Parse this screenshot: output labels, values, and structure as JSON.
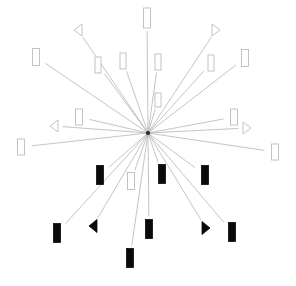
{
  "figure": {
    "title": "",
    "width": 296,
    "height": 286,
    "background_color": "#ffffff",
    "center": {
      "x": 148,
      "y": 133
    }
  },
  "style": {
    "ray_color": "#aaaaaa",
    "ray_width": 0.7,
    "open_marker_fill": "#ffffff",
    "open_marker_stroke": "#b5b5b5",
    "filled_marker_fill": "#0a0a0a",
    "filled_marker_stroke": "#0a0a0a",
    "marker_stroke_width": 0.8
  },
  "chart_data": {
    "type": "scatter",
    "title": "",
    "subtitle": "",
    "xlabel": "",
    "ylabel": "",
    "xlim": [
      0,
      296
    ],
    "ylim": [
      0,
      286
    ],
    "grid": false,
    "legend": null,
    "annotations": [],
    "center": {
      "x": 148,
      "y": 133
    },
    "tick_labels": [],
    "points": [
      {
        "id": "p01",
        "x": 147,
        "y": 18,
        "marker": "rect",
        "style": "open",
        "size": [
          7,
          20
        ],
        "angle_deg": 89,
        "radius": 115
      },
      {
        "id": "p02",
        "x": 78,
        "y": 30,
        "marker": "triangle-left",
        "style": "open",
        "size": [
          8,
          12
        ],
        "angle_deg": 124,
        "radius": 125
      },
      {
        "id": "p03",
        "x": 216,
        "y": 30,
        "marker": "triangle-right",
        "style": "open",
        "size": [
          8,
          12
        ],
        "angle_deg": 55,
        "radius": 124
      },
      {
        "id": "p04",
        "x": 36,
        "y": 57,
        "marker": "rect",
        "style": "open",
        "size": [
          7,
          17
        ],
        "angle_deg": 149,
        "radius": 132
      },
      {
        "id": "p05",
        "x": 98,
        "y": 65,
        "marker": "rect",
        "style": "open",
        "size": [
          6,
          16
        ],
        "angle_deg": 126,
        "radius": 85
      },
      {
        "id": "p06",
        "x": 123,
        "y": 61,
        "marker": "rect",
        "style": "open",
        "size": [
          6,
          16
        ],
        "angle_deg": 109,
        "radius": 76
      },
      {
        "id": "p07",
        "x": 158,
        "y": 62,
        "marker": "rect",
        "style": "open",
        "size": [
          6,
          16
        ],
        "angle_deg": 80,
        "radius": 72
      },
      {
        "id": "p08",
        "x": 211,
        "y": 63,
        "marker": "rect",
        "style": "open",
        "size": [
          6,
          16
        ],
        "angle_deg": 53,
        "radius": 101
      },
      {
        "id": "p09",
        "x": 245,
        "y": 58,
        "marker": "rect",
        "style": "open",
        "size": [
          7,
          17
        ],
        "angle_deg": 38,
        "radius": 123
      },
      {
        "id": "p10",
        "x": 158,
        "y": 100,
        "marker": "rect",
        "style": "open",
        "size": [
          6,
          14
        ],
        "angle_deg": 73,
        "radius": 34
      },
      {
        "id": "p11",
        "x": 79,
        "y": 117,
        "marker": "rect",
        "style": "open",
        "size": [
          7,
          16
        ],
        "angle_deg": 168,
        "radius": 70
      },
      {
        "id": "p12",
        "x": 54,
        "y": 126,
        "marker": "triangle-left",
        "style": "open",
        "size": [
          8,
          12
        ],
        "angle_deg": 176,
        "radius": 94
      },
      {
        "id": "p13",
        "x": 21,
        "y": 147,
        "marker": "rect",
        "style": "open",
        "size": [
          7,
          16
        ],
        "angle_deg": 186,
        "radius": 128
      },
      {
        "id": "p14",
        "x": 234,
        "y": 117,
        "marker": "rect",
        "style": "open",
        "size": [
          7,
          16
        ],
        "angle_deg": 10,
        "radius": 87
      },
      {
        "id": "p15",
        "x": 247,
        "y": 128,
        "marker": "triangle-right",
        "style": "open",
        "size": [
          8,
          12
        ],
        "angle_deg": 3,
        "radius": 99
      },
      {
        "id": "p16",
        "x": 275,
        "y": 152,
        "marker": "rect",
        "style": "open",
        "size": [
          7,
          16
        ],
        "angle_deg": 351,
        "radius": 128
      },
      {
        "id": "p17",
        "x": 100,
        "y": 175,
        "marker": "rect",
        "style": "filled",
        "size": [
          7,
          19
        ],
        "angle_deg": 221,
        "radius": 63
      },
      {
        "id": "p18",
        "x": 131,
        "y": 181,
        "marker": "rect",
        "style": "open",
        "size": [
          7,
          17
        ],
        "angle_deg": 249,
        "radius": 51
      },
      {
        "id": "p19",
        "x": 162,
        "y": 174,
        "marker": "rect",
        "style": "filled",
        "size": [
          7,
          19
        ],
        "angle_deg": 288,
        "radius": 43
      },
      {
        "id": "p20",
        "x": 205,
        "y": 175,
        "marker": "rect",
        "style": "filled",
        "size": [
          7,
          19
        ],
        "angle_deg": 321,
        "radius": 71
      },
      {
        "id": "p21",
        "x": 57,
        "y": 233,
        "marker": "rect",
        "style": "filled",
        "size": [
          7,
          19
        ],
        "angle_deg": 226,
        "radius": 137
      },
      {
        "id": "p22",
        "x": 93,
        "y": 226,
        "marker": "triangle-left",
        "style": "filled",
        "size": [
          8,
          13
        ],
        "angle_deg": 235,
        "radius": 108
      },
      {
        "id": "p23",
        "x": 149,
        "y": 229,
        "marker": "rect",
        "style": "filled",
        "size": [
          7,
          19
        ],
        "angle_deg": 270,
        "radius": 96
      },
      {
        "id": "p24",
        "x": 206,
        "y": 228,
        "marker": "triangle-right",
        "style": "filled",
        "size": [
          8,
          13
        ],
        "angle_deg": 303,
        "radius": 112
      },
      {
        "id": "p25",
        "x": 232,
        "y": 232,
        "marker": "rect",
        "style": "filled",
        "size": [
          7,
          19
        ],
        "angle_deg": 310,
        "radius": 132
      },
      {
        "id": "p26",
        "x": 130,
        "y": 258,
        "marker": "rect",
        "style": "filled",
        "size": [
          7,
          19
        ],
        "angle_deg": 262,
        "radius": 126
      }
    ]
  }
}
